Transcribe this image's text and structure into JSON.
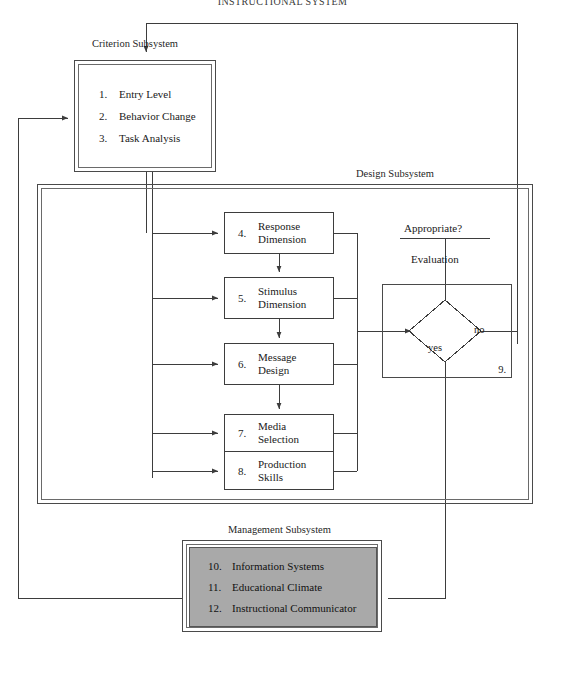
{
  "page": {
    "title": "INSTRUCTIONAL SYSTEM"
  },
  "subsystems": {
    "criterion": {
      "caption": "Criterion Subsystem",
      "items": [
        {
          "num": "1.",
          "label": "Entry Level"
        },
        {
          "num": "2.",
          "label": "Behavior Change"
        },
        {
          "num": "3.",
          "label": "Task Analysis"
        }
      ]
    },
    "design": {
      "caption": "Design Subsystem",
      "items": [
        {
          "num": "4.",
          "label": "Response\nDimension"
        },
        {
          "num": "5.",
          "label": "Stimulus\nDimension"
        },
        {
          "num": "6.",
          "label": "Message\nDesign"
        },
        {
          "num": "7.",
          "label": "Media\nSelection"
        },
        {
          "num": "8.",
          "label": "Production\nSkills"
        }
      ]
    },
    "management": {
      "caption": "Management Subsystem",
      "fill_color": "#a9a9a9",
      "items": [
        {
          "num": "10.",
          "label": "Information Systems"
        },
        {
          "num": "11.",
          "label": "Educational Climate"
        },
        {
          "num": "12.",
          "label": "Instructional Communicator"
        }
      ]
    }
  },
  "decision": {
    "question": "Appropriate?",
    "name": "Evaluation",
    "step_number": "9.",
    "branch_yes": "yes",
    "branch_no": "no"
  },
  "colors": {
    "line": "#3d3d3d",
    "frame": "#4a4a4a",
    "text": "#1a1a1a",
    "management_fill": "#a9a9a9",
    "background": "#ffffff"
  }
}
